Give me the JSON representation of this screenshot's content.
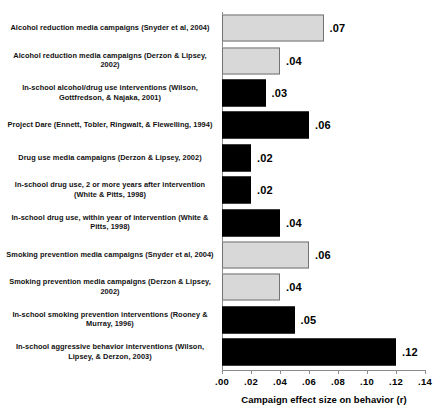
{
  "chart_data": {
    "type": "bar",
    "orientation": "horizontal",
    "title": "",
    "xlabel": "Campaign effect size on behavior (r)",
    "ylabel": "",
    "xlim": [
      0.0,
      0.14
    ],
    "grid": false,
    "legend": null,
    "xticklabels": [
      ".00",
      ".02",
      ".04",
      ".06",
      ".08",
      ".10",
      ".12",
      ".14"
    ],
    "xtickvalues": [
      0.0,
      0.02,
      0.04,
      0.06,
      0.08,
      0.1,
      0.12,
      0.14
    ],
    "categories": [
      "Alcohol reduction media campaigns (Snyder et al, 2004)",
      "Alcohol reduction media campaigns (Derzon & Lipsey, 2002)",
      "In-school alcohol/drug use interventions (Wilson, Gottfredson, & Najaka, 2001)",
      "Project Dare (Ennett, Tobler, Ringwalt,  & Flewelling, 1994)",
      "Drug use media campaigns (Derzon & Lipsey, 2002)",
      "In-school drug use, 2 or more years after intervention (White & Pitts, 1998)",
      "In-school drug use, within year of intervention (White & Pitts, 1998)",
      "Smoking prevention media campaigns (Snyder et al, 2004)",
      "Smoking prevention media campaigns (Derzon & Lipsey, 2002)",
      "In-school smoking prevention interventions (Rooney & Murray, 1996)",
      "In-school aggressive behavior interventions (Wilson, Lipsey, & Derzon, 2003)"
    ],
    "values": [
      0.07,
      0.04,
      0.03,
      0.06,
      0.02,
      0.02,
      0.04,
      0.06,
      0.04,
      0.05,
      0.12
    ],
    "value_labels": [
      ".07",
      ".04",
      ".03",
      ".06",
      ".02",
      ".02",
      ".04",
      ".06",
      ".04",
      ".05",
      ".12"
    ],
    "bar_styles": [
      "light",
      "light",
      "dark",
      "dark",
      "dark",
      "dark",
      "dark",
      "light",
      "light",
      "dark",
      "dark"
    ],
    "colors": {
      "dark_bar": "#000000",
      "light_bar": "#d8d8d8",
      "light_bar_border": "#737373",
      "axis": "#8c8c8c",
      "text": "#000000",
      "background": "#ffffff"
    }
  }
}
